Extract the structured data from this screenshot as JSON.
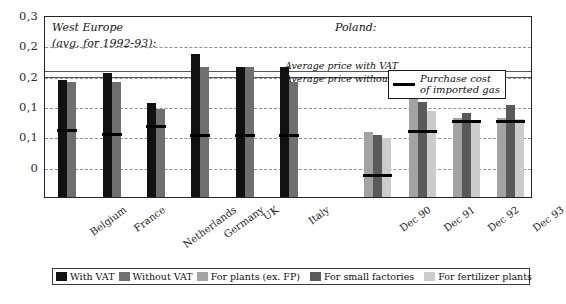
{
  "chart_data": {
    "type": "bar",
    "title": "",
    "xlabel": "",
    "ylabel": "",
    "ylim": [
      0,
      0.3
    ],
    "grid": true,
    "legend_position": "bottom",
    "y_ticks": [
      {
        "label": "0,3",
        "value": 0.3
      },
      {
        "label": "0,2",
        "value": 0.25
      },
      {
        "label": "0,2",
        "value": 0.2
      },
      {
        "label": "0,1",
        "value": 0.15
      },
      {
        "label": "0,1",
        "value": 0.1
      },
      {
        "label": "0",
        "value": 0.05
      },
      {
        "label": "",
        "value": 0.0
      }
    ],
    "panels": [
      {
        "name": "west-europe",
        "heading_line1": "West Europe",
        "heading_line2": "(avg. for 1992-93):",
        "categories": [
          "Belgium",
          "France",
          "Netherlands",
          "Germany",
          "UK",
          "Italy"
        ],
        "series": [
          {
            "name": "With VAT",
            "key": "vat",
            "color": "#111111",
            "values": [
              0.193,
              0.205,
              0.155,
              0.236,
              0.215,
              0.215
            ]
          },
          {
            "name": "Without VAT",
            "key": "novat",
            "color": "#6f6f6f",
            "values": [
              0.19,
              0.19,
              0.145,
              0.215,
              0.215,
              0.19
            ]
          }
        ],
        "markers": [
          {
            "name": "purchase-cost",
            "values": [
              0.113,
              0.107,
              0.12,
              0.105,
              0.105,
              0.105
            ]
          }
        ]
      },
      {
        "name": "poland",
        "heading_line1": "Poland:",
        "heading_line2": "",
        "categories": [
          "Dec 90",
          "Dec 91",
          "Dec 92",
          "Dec 93"
        ],
        "series": [
          {
            "name": "For plants (ex. FP)",
            "key": "plants",
            "color": "#a3a3a3",
            "values": [
              0.107,
              0.165,
              0.13,
              0.131
            ]
          },
          {
            "name": "For small factories",
            "key": "small",
            "color": "#5a5a5a",
            "values": [
              0.102,
              0.157,
              0.139,
              0.152
            ]
          },
          {
            "name": "For fertilizer plants",
            "key": "fert",
            "color": "#cccccc",
            "values": [
              0.098,
              0.142,
              0.125,
              0.128
            ]
          }
        ],
        "markers": [
          {
            "name": "purchase-cost",
            "values": [
              0.04,
              0.112,
              0.129,
              0.128
            ]
          }
        ]
      }
    ],
    "reference_lines": [
      {
        "name": "average-price-with-vat",
        "label": "Average price with VAT",
        "value": 0.2115
      },
      {
        "name": "average-price-without-vat",
        "label": "Average price without VAT",
        "value": 0.2015
      }
    ],
    "annotations": [
      {
        "name": "purchase-cost-key",
        "line1": "Purchase cost",
        "line2": "of imported gas"
      }
    ],
    "legend": [
      {
        "label": "With VAT",
        "color": "#111111"
      },
      {
        "label": "Without VAT",
        "color": "#6f6f6f"
      },
      {
        "label": "For plants (ex. FP)",
        "color": "#a3a3a3"
      },
      {
        "label": "For small factories",
        "color": "#5a5a5a"
      },
      {
        "label": "For fertilizer plants",
        "color": "#cccccc"
      }
    ]
  }
}
